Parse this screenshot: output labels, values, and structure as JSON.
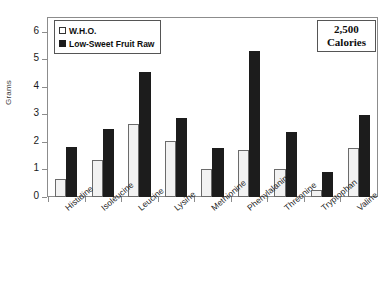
{
  "chart_data": {
    "type": "bar",
    "title": "",
    "xlabel": "",
    "ylabel": "Grams",
    "ylim": [
      0,
      6.5
    ],
    "yticks": [
      0,
      1,
      2,
      3,
      4,
      5,
      6
    ],
    "ytick_labels": [
      "0",
      "1",
      "2",
      "3",
      "4",
      "5",
      "6"
    ],
    "grid": false,
    "legend_position": "top-left",
    "categories": [
      "Histidine",
      "Isoleucine",
      "Leucine",
      "Lysine",
      "Methionine",
      "Phenylalanine",
      "Threonine",
      "Tryptophan",
      "Valine"
    ],
    "series": [
      {
        "name": "W.H.O.",
        "color": "#f2f2f2",
        "values": [
          0.66,
          1.34,
          2.64,
          2.03,
          1.01,
          1.69,
          1.02,
          0.25,
          1.77
        ]
      },
      {
        "name": "Low-Sweet Fruit Raw",
        "color": "#1c1c1c",
        "values": [
          1.83,
          2.46,
          4.54,
          2.88,
          1.78,
          5.29,
          2.35,
          0.9,
          2.98
        ]
      }
    ],
    "annotations": [
      {
        "name": "calorie-box",
        "line1": "2,500",
        "line2": "Calories"
      }
    ]
  },
  "legend": {
    "items": [
      {
        "label": "W.H.O.",
        "marker": "empty-square-marker"
      },
      {
        "label": "Low-Sweet Fruit Raw",
        "marker": "filled-square-marker"
      }
    ]
  }
}
